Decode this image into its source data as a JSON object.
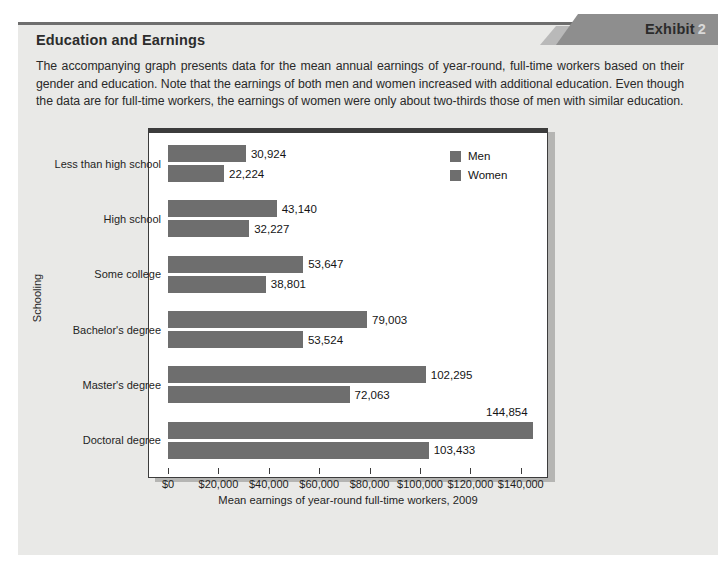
{
  "exhibit": {
    "banner_word": "Exhibit",
    "banner_number": "2",
    "title": "Education and Earnings",
    "description": "The accompanying graph presents data for the mean annual earnings of year-round, full-time workers based on their gender and education. Note that the earnings of both men and women increased with additional education. Even though the data are for full-time workers, the earnings of women were only about two-thirds those of men with similar education.",
    "source": "Source: http://www.census.gov/."
  },
  "chart_data": {
    "type": "bar",
    "orientation": "horizontal",
    "title": "",
    "xlabel": "Mean earnings of year-round full-time workers, 2009",
    "ylabel": "Schooling",
    "categories": [
      "Less than high school",
      "High school",
      "Some college",
      "Bachelor's degree",
      "Master's degree",
      "Doctoral degree"
    ],
    "series": [
      {
        "name": "Men",
        "color": "#6e6e6e",
        "values": [
          30924,
          43140,
          53647,
          79003,
          102295,
          144854
        ],
        "labels": [
          "30,924",
          "43,140",
          "53,647",
          "79,003",
          "102,295",
          "144,854"
        ]
      },
      {
        "name": "Women",
        "color": "#6e6e6e",
        "values": [
          22224,
          32227,
          38801,
          53524,
          72063,
          103433
        ],
        "labels": [
          "22,224",
          "32,227",
          "38,801",
          "53,524",
          "72,063",
          "103,433"
        ]
      }
    ],
    "xlim": [
      0,
      150000
    ],
    "xticks": [
      0,
      20000,
      40000,
      60000,
      80000,
      100000,
      120000,
      140000
    ],
    "xtick_labels": [
      "$0",
      "$20,000",
      "$40,000",
      "$60,000",
      "$80,000",
      "$100,000",
      "$120,000",
      "$140,000"
    ],
    "grid": false,
    "legend_position": "top-right",
    "legend": [
      "Men",
      "Women"
    ]
  }
}
